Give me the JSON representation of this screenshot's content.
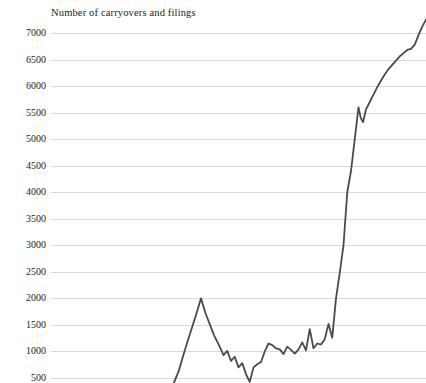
{
  "chart_data": {
    "type": "line",
    "title": "Number of carryovers and filings",
    "xlabel": "",
    "ylabel": "Number of carryovers and filings",
    "ylim": [
      250,
      7400
    ],
    "xlim": [
      0,
      100
    ],
    "grid": true,
    "legend": null,
    "yticks": [
      7000,
      6500,
      6000,
      5500,
      5000,
      4500,
      4000,
      3500,
      3000,
      2500,
      2000,
      1500,
      1000,
      500
    ],
    "ytick_labels": [
      "7000",
      "6500",
      "6000",
      "5500",
      "5000",
      "4500",
      "4000",
      "3500",
      "3000",
      "2500",
      "2000",
      "1500",
      "1000",
      "500"
    ],
    "xticks": [],
    "xtick_labels": [],
    "series": [
      {
        "name": "Carryovers and filings",
        "color": "#4a4a4a",
        "x": [
          32.3,
          34.0,
          35.5,
          37.0,
          38.5,
          40.0,
          41.2,
          42.3,
          43.5,
          44.8,
          46.0,
          47.0,
          48.0,
          49.0,
          50.0,
          51.0,
          52.0,
          53.0,
          54.0,
          55.0,
          56.0,
          57.0,
          58.0,
          59.0,
          60.0,
          61.0,
          62.0,
          63.0,
          64.0,
          65.0,
          66.0,
          67.0,
          68.0,
          69.0,
          70.0,
          71.0,
          72.0,
          73.0,
          74.0,
          75.0,
          76.0,
          77.0,
          78.0,
          79.0,
          80.0,
          81.0,
          82.0,
          82.6,
          83.2,
          84.0,
          85.0,
          86.0,
          87.0,
          88.0,
          89.0,
          90.0,
          91.0,
          92.0,
          93.0,
          94.0,
          95.0,
          96.0,
          97.0,
          98.0,
          99.0,
          100.0
        ],
        "y": [
          330,
          620,
          980,
          1320,
          1650,
          2000,
          1720,
          1520,
          1300,
          1120,
          930,
          1010,
          820,
          900,
          700,
          780,
          570,
          430,
          700,
          760,
          800,
          1000,
          1150,
          1120,
          1060,
          1040,
          950,
          1090,
          1030,
          960,
          1040,
          1170,
          1020,
          1420,
          1060,
          1150,
          1130,
          1230,
          1520,
          1260,
          2000,
          2480,
          3000,
          4000,
          4400,
          5000,
          5600,
          5400,
          5320,
          5560,
          5700,
          5840,
          5980,
          6100,
          6220,
          6320,
          6400,
          6480,
          6560,
          6620,
          6680,
          6700,
          6780,
          6960,
          7120,
          7250
        ]
      }
    ]
  },
  "axes": {
    "y_axis_name": "y-axis",
    "x_axis_name": "x-axis"
  }
}
